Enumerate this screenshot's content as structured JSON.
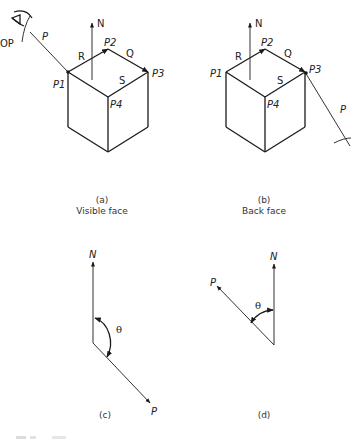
{
  "figure": {
    "panel_a": {
      "labels": {
        "viewpoint": "OP",
        "view_vector": "P",
        "normal": "N",
        "edge_r": "R",
        "edge_q": "Q",
        "edge_s": "S",
        "p1": "P1",
        "p2": "P2",
        "p3": "P3",
        "p4": "P4"
      },
      "tag": "(a)",
      "caption": "Visible face",
      "icons": [
        "eye-icon"
      ]
    },
    "panel_b": {
      "labels": {
        "view_vector": "P",
        "normal": "N",
        "edge_r": "R",
        "edge_q": "Q",
        "edge_s": "S",
        "p1": "P1",
        "p2": "P2",
        "p3": "P3",
        "p4": "P4"
      },
      "tag": "(b)",
      "caption": "Back face",
      "icons": [
        "eye-icon"
      ]
    },
    "panel_c": {
      "labels": {
        "normal": "N",
        "view_vector": "P",
        "angle": "θ"
      },
      "tag": "(c)",
      "note": "angle between N and P greater than 90°"
    },
    "panel_d": {
      "labels": {
        "normal": "N",
        "view_vector": "P",
        "angle": "θ"
      },
      "tag": "(d)",
      "note": "angle between N and P less than 90°"
    }
  }
}
